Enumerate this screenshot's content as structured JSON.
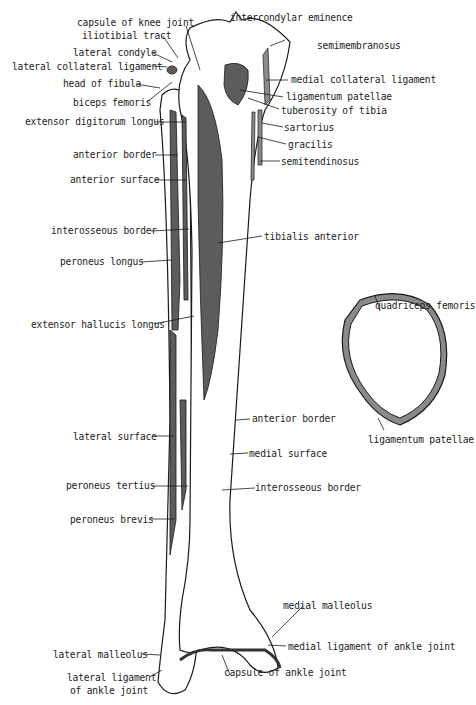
{
  "figure": {
    "colors": {
      "muscle": "#5c5c5c",
      "bone": "#ffffff",
      "outline": "#1a1a1a",
      "ligament": "#8a8a8a"
    }
  },
  "labels": {
    "capsule_knee": "capsule of knee joint",
    "iliotibial": "iliotibial tract",
    "lateral_condyle": "lateral condyle",
    "lateral_collateral": "lateral collateral ligament",
    "head_fibula": "head of fibula",
    "biceps": "biceps femoris",
    "ext_digitorum": "extensor digitorum longus",
    "ant_border_l": "anterior border",
    "ant_surface": "anterior surface",
    "interosseous_l": "interosseous border",
    "peroneus_longus": "peroneus longus",
    "ext_hallucis": "extensor hallucis longus",
    "lateral_surface": "lateral surface",
    "peroneus_tertius": "peroneus tertius",
    "peroneus_brevis": "peroneus brevis",
    "lateral_malleolus": "lateral malleolus",
    "lateral_lig_1": "lateral ligament",
    "lateral_lig_2": "of ankle joint",
    "intercondylar": "intercondylar eminence",
    "semimembranosus": "semimembranosus",
    "medial_collateral": "medial collateral ligament",
    "lig_patellae": "ligamentum patellae",
    "tuberosity": "tuberosity of tibia",
    "sartorius": "sartorius",
    "gracilis": "gracilis",
    "semitendinosus": "semitendinosus",
    "tibialis_anterior": "tibialis anterior",
    "ant_border_r": "anterior border",
    "medial_surface": "medial surface",
    "interosseous_r": "interosseous border",
    "medial_malleolus": "medial malleolus",
    "medial_lig_ankle": "medial ligament of ankle joint",
    "capsule_ankle": "capsule of ankle joint",
    "quadriceps": "quadriceps femoris",
    "patella_lig": "ligamentum patellae"
  }
}
